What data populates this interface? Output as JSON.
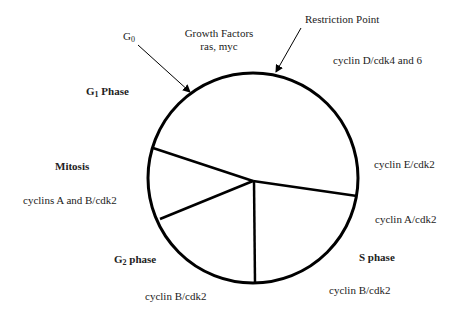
{
  "diagram": {
    "type": "cell-cycle",
    "labels": {
      "g0": {
        "main": "G",
        "sub": "0"
      },
      "growth_factors": {
        "line1": "Growth Factors",
        "line2": "ras, myc"
      },
      "restriction_point": "Restriction Point",
      "cyclin_d": "cyclin D/cdk4 and 6",
      "g1_phase": {
        "main": "G",
        "sub": "1",
        "rest": " Phase"
      },
      "mitosis": "Mitosis",
      "cyclins_a_b": "cyclins A and B/cdk2",
      "g2_phase": {
        "main": "G",
        "sub": "2",
        "rest": " phase"
      },
      "cyclin_b_g2": "cyclin B/cdk2",
      "cyclin_e": "cyclin E/cdk2",
      "cyclin_a": "cyclin A/cdk2",
      "s_phase": "S phase",
      "cyclin_b_s": "cyclin B/cdk2"
    },
    "colors": {
      "stroke": "#000000",
      "text": "#222222",
      "background": "#ffffff"
    }
  }
}
